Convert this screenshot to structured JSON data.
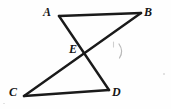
{
  "figure": {
    "canvas": {
      "width": 171,
      "height": 109
    },
    "background_color": "#fefefe",
    "stroke_color": "#1a1a1a",
    "label_color": "#151515",
    "points": {
      "A": {
        "x": 59,
        "y": 16,
        "label": "A",
        "label_x": 43,
        "label_y": 6
      },
      "B": {
        "x": 141,
        "y": 13,
        "label": "B",
        "label_x": 144,
        "label_y": 6
      },
      "C": {
        "x": 24,
        "y": 96,
        "label": "C",
        "label_x": 9,
        "label_y": 86
      },
      "D": {
        "x": 109,
        "y": 90,
        "label": "D",
        "label_x": 112,
        "label_y": 86
      },
      "E": {
        "x": 86,
        "y": 54,
        "label": "E",
        "label_x": 69,
        "label_y": 43
      }
    },
    "segments": [
      {
        "name": "segment-AB",
        "from": "A",
        "to": "B",
        "width": 2.6
      },
      {
        "name": "segment-AD",
        "from": "A",
        "to": "D",
        "width": 2.4
      },
      {
        "name": "segment-CB",
        "from": "C",
        "to": "B",
        "width": 2.4
      },
      {
        "name": "segment-CD",
        "from": "C",
        "to": "D",
        "width": 2.6
      }
    ],
    "marks": {
      "arc": {
        "x": 120,
        "y": 44,
        "width": 5,
        "height": 14,
        "color": "#b8b8b8"
      },
      "tick": {
        "x": 113,
        "y": 42,
        "width": 2,
        "height": 6,
        "color": "#c9c9c9"
      }
    }
  }
}
